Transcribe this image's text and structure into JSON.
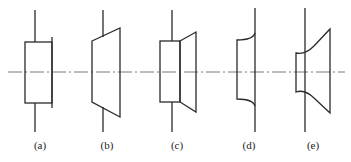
{
  "figure": {
    "colors": {
      "line": "#2a2a2a",
      "centerline": "#555555",
      "background": "#ffffff"
    },
    "centerline": {
      "y": 72,
      "x_start": 8,
      "x_end": 345,
      "style": "dash-dot"
    },
    "panels": [
      {
        "id": "a",
        "label": "(a)",
        "shape": "rectangle with flange line on right",
        "label_x": 40
      },
      {
        "id": "b",
        "label": "(b)",
        "shape": "trapezoid widening to the right",
        "label_x": 107
      },
      {
        "id": "c",
        "label": "(c)",
        "shape": "rectangle joined to trapezoid",
        "label_x": 177
      },
      {
        "id": "d",
        "label": "(d)",
        "shape": "profile with concave curved ends",
        "label_x": 249
      },
      {
        "id": "e",
        "label": "(e)",
        "shape": "flared profile with curved necks",
        "label_x": 313
      }
    ]
  }
}
